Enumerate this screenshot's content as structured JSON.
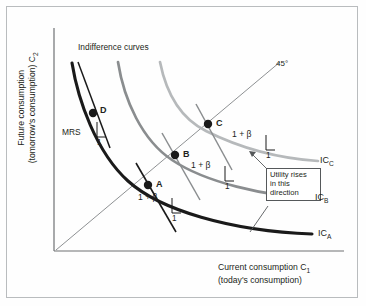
{
  "figure": {
    "type": "economics-indifference-curve-diagram",
    "axes": {
      "y_title_line1": "Future consumption",
      "y_title_line2": "(tomorrow's consumption) C",
      "y_title_sub": "2",
      "x_title_line1": "Current consumption C",
      "x_title_sub": "1",
      "x_title_line2": "(today's consumption)"
    },
    "annotations": {
      "indifference_curves": "Indifference curves",
      "forty_five": "45°",
      "mrs": "MRS",
      "utility_box_line1": "Utility rises",
      "utility_box_line2": "in this",
      "utility_box_line3": "direction"
    },
    "points": [
      {
        "label": "D",
        "x": 93,
        "y": 113
      },
      {
        "label": "C",
        "x": 208,
        "y": 124
      },
      {
        "label": "B",
        "x": 175,
        "y": 155
      },
      {
        "label": "A",
        "x": 148,
        "y": 185
      }
    ],
    "slope_labels": [
      {
        "text": "1 + β",
        "one": "1"
      },
      {
        "text": "1 + β",
        "one": "1"
      },
      {
        "text": "1 + β",
        "one": "1"
      }
    ],
    "mrs_one": "1",
    "curve_labels": [
      {
        "name": "IC",
        "sub": "C"
      },
      {
        "name": "IC",
        "sub": "B"
      },
      {
        "name": "IC",
        "sub": "A"
      }
    ],
    "colors": {
      "curve_a": "#1a1a1a",
      "curve_b": "#8a8d8f",
      "curve_c": "#b6b9bb",
      "axis": "#6e7173",
      "frame": "#b9bcbe",
      "text": "#231f20",
      "background": "#fefefe"
    }
  }
}
